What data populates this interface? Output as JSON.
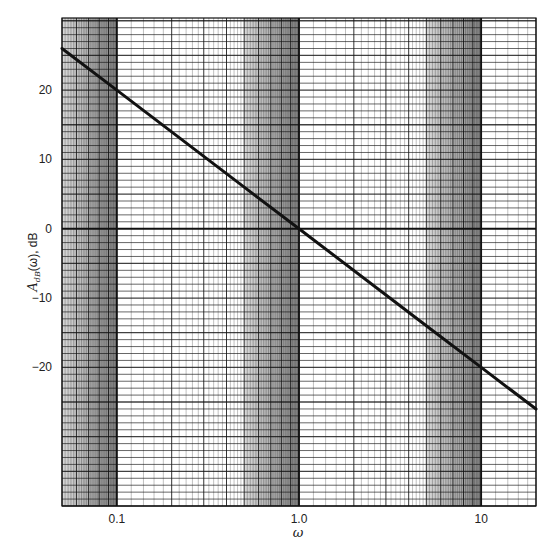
{
  "chart_data": {
    "type": "line",
    "title": "",
    "xlabel": "ω",
    "ylabel": "A_dB(ω), dB",
    "ylabel_parts": {
      "main": "A",
      "sub": "dB",
      "rest": "(ω), dB"
    },
    "xscale": "log",
    "xlim": [
      0.05,
      20
    ],
    "ylim": [
      -40,
      30.4
    ],
    "grid": true,
    "legend": null,
    "x_ticks": [
      {
        "value": 0.1,
        "label": "0.1"
      },
      {
        "value": 1.0,
        "label": "1.0"
      },
      {
        "value": 10,
        "label": "10"
      }
    ],
    "y_ticks": [
      {
        "value": 20,
        "label": "20"
      },
      {
        "value": 10,
        "label": "10"
      },
      {
        "value": 0,
        "label": "0"
      },
      {
        "value": -10,
        "label": "−10"
      },
      {
        "value": -20,
        "label": "−20"
      }
    ],
    "series": [
      {
        "name": "A_dB(ω) = −20·log10(ω)",
        "x": [
          0.05,
          0.1,
          0.5,
          1.0,
          5,
          10,
          20
        ],
        "y": [
          26.0,
          20.0,
          6.0,
          0.0,
          -14.0,
          -20.0,
          -26.0
        ],
        "color": "#111111"
      }
    ],
    "shaded_bands": [
      {
        "from": 0.05,
        "to": 0.1
      },
      {
        "from": 0.5,
        "to": 1.0
      },
      {
        "from": 5,
        "to": 10
      }
    ]
  }
}
